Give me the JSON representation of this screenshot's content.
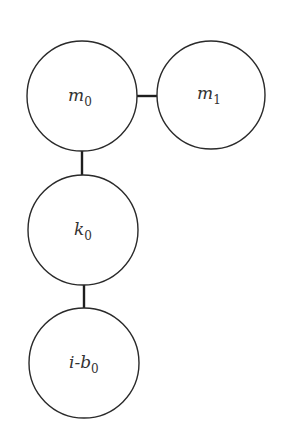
{
  "diagram": {
    "type": "tree",
    "nodes": [
      {
        "id": "m0",
        "base": "m",
        "sub": "0",
        "cx": 82,
        "cy": 96,
        "r": 55
      },
      {
        "id": "m1",
        "base": "m",
        "sub": "1",
        "cx": 211,
        "cy": 95,
        "r": 54
      },
      {
        "id": "k0",
        "base": "k",
        "sub": "0",
        "cx": 83,
        "cy": 230,
        "r": 55
      },
      {
        "id": "ib0",
        "base": "i-b",
        "sub": "0",
        "cx": 84,
        "cy": 363,
        "r": 55
      }
    ],
    "edges": [
      {
        "from": "m0",
        "to": "m1"
      },
      {
        "from": "m0",
        "to": "k0"
      },
      {
        "from": "k0",
        "to": "ib0"
      }
    ],
    "colors": {
      "stroke": "#2a2a2a",
      "text": "#333333",
      "background": "#ffffff"
    }
  }
}
